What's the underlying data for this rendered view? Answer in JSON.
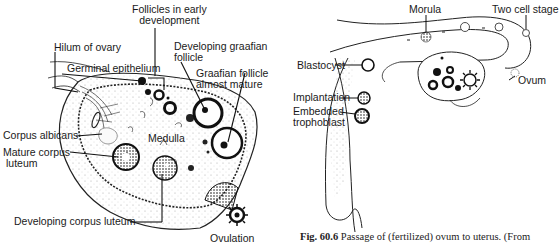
{
  "left_diagram": {
    "title": "Ovary cross-section",
    "labels": {
      "follicles_early": "Follicles in early development",
      "follicles_early_l1": "Follicles in early",
      "follicles_early_l2": "development",
      "hilum": "Hilum of ovary",
      "developing_graafian_l1": "Developing graafian",
      "developing_graafian_l2": "follicle",
      "germinal_epithelium": "Germinal epithelium",
      "graafian_mature_l1": "Graafian follicle",
      "graafian_mature_l2": "almost mature",
      "corpus_albicans": "Corpus albicans",
      "medulla": "Medulla",
      "mature_corpus_l1": "Mature corpus",
      "mature_corpus_l2": "luteum",
      "developing_corpus": "Developing corpus  luteum",
      "ovulation": "Ovulation"
    }
  },
  "right_diagram": {
    "title": "Passage of fertilized ovum to uterus",
    "labels": {
      "morula": "Morula",
      "two_cell": "Two cell stage",
      "blastocyst": "Blastocyst",
      "ovum": "Ovum",
      "implantation": "Implantation",
      "embedded_l1": "Embedded",
      "embedded_l2": "trophoblast"
    }
  },
  "caption": {
    "fig_number": "Fig. 60.6",
    "text": " Passage of (fertilized) ovum to uterus. (From"
  },
  "colors": {
    "ink": "#1a1a1a",
    "background": "#ffffff",
    "stipple": "#9a9a9a"
  }
}
